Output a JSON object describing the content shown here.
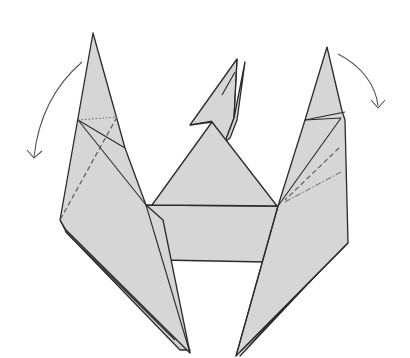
{
  "diagram": {
    "type": "origami-folding-step",
    "description": "Folded paper model with a central body, a small head on top, and two tall pointed flaps to the left and right",
    "colors": {
      "paper_fill": "#d6d6d6",
      "outline": "#2a2a2a",
      "background": "#ffffff",
      "arrow": "#555555"
    },
    "parts": [
      {
        "id": "left-flap",
        "label": "Left pointed flap"
      },
      {
        "id": "right-flap",
        "label": "Right pointed flap"
      },
      {
        "id": "center-body",
        "label": "Central rectangular body"
      },
      {
        "id": "center-triangle",
        "label": "Central triangular top"
      },
      {
        "id": "head",
        "label": "Small head point"
      }
    ],
    "annotations": [
      {
        "id": "left-fold-arrow",
        "label": "Fold-down arrow, left side",
        "direction": "counterclockwise-down"
      },
      {
        "id": "right-fold-arrow",
        "label": "Fold-down arrow, right side",
        "direction": "clockwise-down"
      },
      {
        "id": "left-valley-fold",
        "label": "Valley fold line (dashed), left flap"
      },
      {
        "id": "right-valley-fold",
        "label": "Valley fold line (dashed), right flap"
      },
      {
        "id": "right-mountain-fold",
        "label": "Mountain fold line (dash-dot), right flap"
      },
      {
        "id": "left-hidden-line",
        "label": "Hidden edge line (dotted), left flap"
      }
    ]
  }
}
